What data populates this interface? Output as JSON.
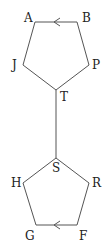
{
  "header_cut_text": "",
  "diagram": {
    "top_pentagon": {
      "vertices": [
        {
          "label": "A",
          "x": 35,
          "y": 22,
          "lx": 24,
          "ly": 22
        },
        {
          "label": "B",
          "x": 77,
          "y": 22,
          "lx": 82,
          "ly": 22
        },
        {
          "label": "P",
          "x": 89,
          "y": 65,
          "lx": 92,
          "ly": 69
        },
        {
          "label": "T",
          "x": 56,
          "y": 90,
          "lx": 60,
          "ly": 101
        },
        {
          "label": "J",
          "x": 23,
          "y": 65,
          "lx": 12,
          "ly": 69
        }
      ],
      "arrow": {
        "edge": "B->A",
        "x": 55,
        "y": 22,
        "direction": "left"
      }
    },
    "connector": {
      "from": "T",
      "to": "S"
    },
    "bottom_pentagon": {
      "vertices": [
        {
          "label": "S",
          "x": 56,
          "y": 158,
          "lx": 52,
          "ly": 172
        },
        {
          "label": "R",
          "x": 89,
          "y": 183,
          "lx": 92,
          "ly": 187
        },
        {
          "label": "F",
          "x": 77,
          "y": 225,
          "lx": 79,
          "ly": 240
        },
        {
          "label": "G",
          "x": 36,
          "y": 225,
          "lx": 25,
          "ly": 240
        },
        {
          "label": "H",
          "x": 23,
          "y": 183,
          "lx": 11,
          "ly": 187
        }
      ],
      "arrow": {
        "edge": "F->G",
        "x": 55,
        "y": 225,
        "direction": "left"
      }
    }
  }
}
